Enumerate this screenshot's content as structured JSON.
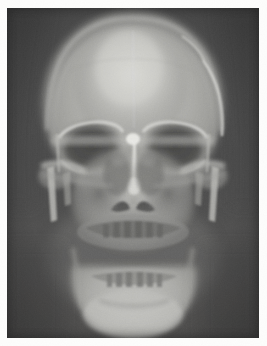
{
  "document": {
    "kind": "radiograph-plate",
    "modality": "X-ray",
    "view": "posteroanterior-skull",
    "caption": "",
    "page_background": "#fdfdfc"
  },
  "plate": {
    "x": 7,
    "y": 8,
    "width": 252,
    "height": 330,
    "background_color": "#4b4b4b",
    "bone_bright_color": "#cfcfcb",
    "bone_mid_color": "#9c9c98",
    "soft_tissue_color": "#6e6e6c",
    "air_dark_color": "#3f3f3f"
  },
  "anatomy": {
    "regions": [
      {
        "id": "cranial-vault",
        "label": "Cranial vault",
        "brightness": 0.78
      },
      {
        "id": "frontal-bone",
        "label": "Frontal bone",
        "brightness": 0.82
      },
      {
        "id": "right-orbit",
        "label": "Right orbit",
        "brightness": 0.34
      },
      {
        "id": "left-orbit",
        "label": "Left orbit",
        "brightness": 0.34
      },
      {
        "id": "supraorbital-ridge",
        "label": "Supraorbital ridge",
        "brightness": 0.7
      },
      {
        "id": "nasal-septum",
        "label": "Nasal septum",
        "brightness": 0.88
      },
      {
        "id": "nasal-aperture",
        "label": "Piriform aperture",
        "brightness": 0.22
      },
      {
        "id": "maxillary-sinuses",
        "label": "Maxillary sinuses",
        "brightness": 0.4
      },
      {
        "id": "zygomatic-arches",
        "label": "Zygomatic arches",
        "brightness": 0.66
      },
      {
        "id": "mastoid-processes",
        "label": "Mastoid processes",
        "brightness": 0.72
      },
      {
        "id": "maxilla-teeth",
        "label": "Maxillary dentition",
        "brightness": 0.3
      },
      {
        "id": "mandible",
        "label": "Mandible",
        "brightness": 0.8
      },
      {
        "id": "mandibular-teeth",
        "label": "Mandibular dentition",
        "brightness": 0.28
      },
      {
        "id": "occlusal-line",
        "label": "Occlusal line",
        "brightness": 0.18
      },
      {
        "id": "midline-suture",
        "label": "Midline / sagittal plane",
        "brightness": 0.86
      }
    ]
  }
}
